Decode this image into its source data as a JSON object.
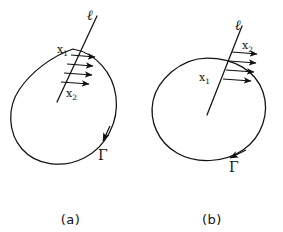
{
  "figure": {
    "background_color": "#ffffff",
    "ink_color": "#111111",
    "panels": [
      {
        "id": "a",
        "caption": "(a)",
        "line_label": "ℓ",
        "curve_label": "Γ",
        "intersection_upper": {
          "base": "x",
          "sub": "1"
        },
        "intersection_lower": {
          "base": "x",
          "sub": "2"
        },
        "arrow_count": 4,
        "curve_orientation": "counterclockwise"
      },
      {
        "id": "b",
        "caption": "(b)",
        "line_label": "ℓ",
        "curve_label": "Γ",
        "intersection_upper": {
          "base": "x",
          "sub": "2"
        },
        "intersection_lower": {
          "base": "x",
          "sub": "1"
        },
        "arrow_count": 4,
        "curve_orientation": "counterclockwise"
      }
    ]
  }
}
